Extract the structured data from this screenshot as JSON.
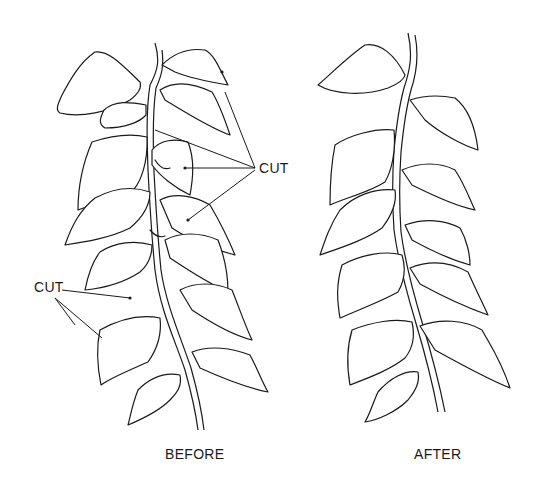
{
  "diagram": {
    "type": "pruning illustration",
    "panels": [
      {
        "id": "before",
        "caption": "BEFORE",
        "callouts": [
          {
            "label": "CUT",
            "targets": 4
          },
          {
            "label": "CUT",
            "targets": 3
          }
        ]
      },
      {
        "id": "after",
        "caption": "AFTER",
        "callouts": []
      }
    ]
  },
  "labels": {
    "cut_right": "CUT",
    "cut_left": "CUT",
    "before": "BEFORE",
    "after": "AFTER"
  },
  "colors": {
    "ink": "#1a1a1a",
    "background": "#ffffff"
  }
}
